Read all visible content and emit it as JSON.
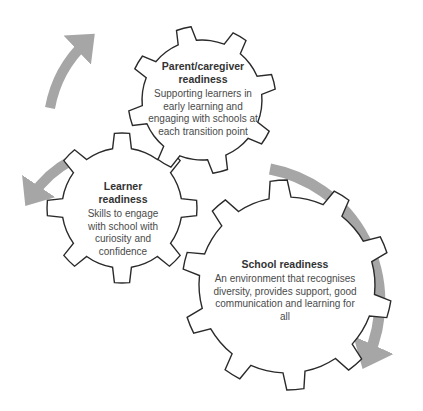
{
  "colors": {
    "gear_stroke": "#2a2a2a",
    "gear_fill": "#ffffff",
    "arrow": "#a6a6a6"
  },
  "gears": {
    "parent": {
      "title": "Parent/caregiver readiness",
      "title_lines": [
        "Parent/caregiver",
        "readiness"
      ],
      "description": "Supporting learners in early learning and engaging with schools at each transition point"
    },
    "learner": {
      "title": "Learner readiness",
      "description": "Skills to engage with school with curiosity and confidence"
    },
    "school": {
      "title": "School readiness",
      "description": "An environment that recognises diversity, provides support, good communication and learning for all"
    }
  },
  "arrows": [
    {
      "name": "arrow-learner-to-parent",
      "direction": "up-right"
    },
    {
      "name": "arrow-parent-to-learner",
      "direction": "down-left"
    },
    {
      "name": "arrow-around-school",
      "direction": "clockwise-down"
    }
  ]
}
